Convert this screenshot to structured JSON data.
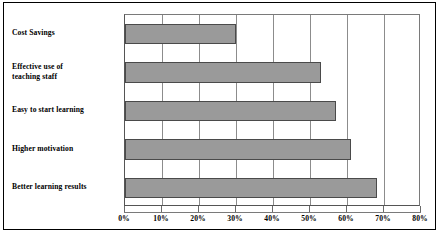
{
  "chart_data": {
    "type": "bar",
    "orientation": "horizontal",
    "title": "",
    "xlabel": "",
    "ylabel": "",
    "categories": [
      "Cost Savings",
      "Effective use of teaching staff",
      "Easy to start learning",
      "Higher motivation",
      "Better learning results"
    ],
    "values": [
      30,
      53,
      57,
      61,
      68
    ],
    "value_suffix": "%",
    "xlim": [
      0,
      80
    ],
    "xticks": [
      0,
      10,
      20,
      30,
      40,
      50,
      60,
      70,
      80
    ],
    "xtick_labels": [
      "0%",
      "10%",
      "20%",
      "30%",
      "40%",
      "50%",
      "60%",
      "70%",
      "80%"
    ],
    "grid": "vertical",
    "legend": "none",
    "bar_color": "#9a9a9a",
    "bar_border_color": "#4a4a4a",
    "frame_color": "#000000",
    "background_color": "#ffffff",
    "category_label_lines": [
      [
        "Cost Savings"
      ],
      [
        "Effective use of",
        "teaching staff"
      ],
      [
        "Easy to start learning"
      ],
      [
        "Higher motivation"
      ],
      [
        "Better learning results"
      ]
    ]
  }
}
